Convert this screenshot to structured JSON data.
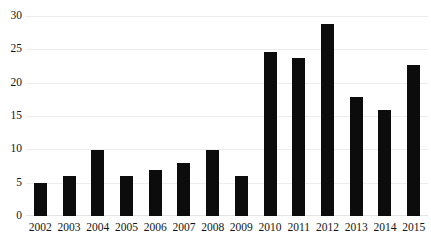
{
  "chart_data": {
    "type": "bar",
    "title": "",
    "xlabel": "",
    "ylabel": "",
    "categories": [
      "2002",
      "2003",
      "2004",
      "2005",
      "2006",
      "2007",
      "2008",
      "2009",
      "2010",
      "2011",
      "2012",
      "2013",
      "2014",
      "2015"
    ],
    "values": [
      5,
      6,
      10,
      6,
      7,
      8,
      10,
      6,
      24.8,
      23.8,
      29,
      18,
      16,
      22.7
    ],
    "ylim": [
      0,
      30
    ],
    "yticks": [
      0,
      5,
      10,
      15,
      20,
      25,
      30
    ],
    "ytick_labels": [
      "0",
      "5",
      "10",
      "15",
      "20",
      "25",
      "30"
    ],
    "grid": true,
    "legend": "none",
    "bar_color": "#0c0c0c",
    "gridline_color": "#ededed",
    "background_color": "#ffffff"
  }
}
